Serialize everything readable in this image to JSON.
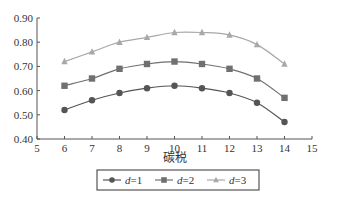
{
  "chart_data": {
    "type": "line",
    "title": "",
    "xlabel": "碳税",
    "ylabel": "",
    "xlim": [
      5,
      15
    ],
    "ylim": [
      0.4,
      0.9
    ],
    "x_ticks": [
      "5",
      "6",
      "7",
      "8",
      "9",
      "10",
      "11",
      "12",
      "13",
      "14",
      "15"
    ],
    "y_ticks": [
      "0.40",
      "0.50",
      "0.60",
      "0.70",
      "0.80",
      "0.90"
    ],
    "grid": false,
    "legend_position": "bottom",
    "x": [
      6,
      7,
      8,
      9,
      10,
      11,
      12,
      13,
      14
    ],
    "series": [
      {
        "name": "d=1",
        "var": "d",
        "eq": "=1",
        "marker": "circle",
        "color": "#555555",
        "values": [
          0.52,
          0.56,
          0.59,
          0.61,
          0.62,
          0.61,
          0.59,
          0.55,
          0.47
        ]
      },
      {
        "name": "d=2",
        "var": "d",
        "eq": "=2",
        "marker": "square",
        "color": "#707070",
        "values": [
          0.62,
          0.65,
          0.69,
          0.71,
          0.72,
          0.71,
          0.69,
          0.65,
          0.57
        ]
      },
      {
        "name": "d=3",
        "var": "d",
        "eq": "=3",
        "marker": "triangle",
        "color": "#a8a8a8",
        "values": [
          0.72,
          0.76,
          0.8,
          0.82,
          0.84,
          0.84,
          0.83,
          0.79,
          0.71
        ]
      }
    ]
  }
}
